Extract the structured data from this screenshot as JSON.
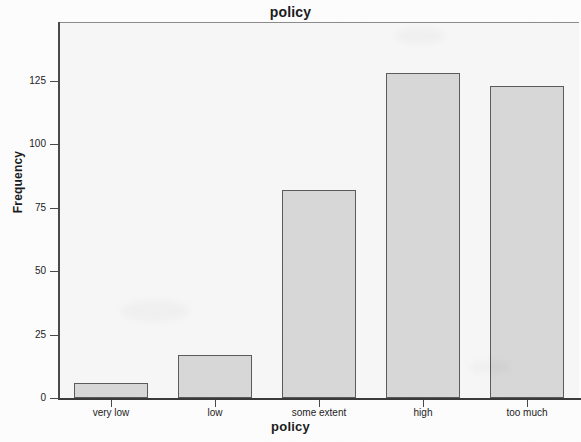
{
  "chart_data": {
    "type": "bar",
    "title": "policy",
    "xlabel": "policy",
    "ylabel": "Frequency",
    "categories": [
      "very low",
      "low",
      "some extent",
      "high",
      "too much"
    ],
    "values": [
      6,
      17,
      82,
      128,
      123
    ],
    "yticks": [
      0,
      25,
      50,
      75,
      100,
      125
    ],
    "ytick_labels": [
      "0",
      "25",
      "50",
      "75",
      "100",
      "125"
    ],
    "ylim": [
      0,
      148
    ],
    "grid": false,
    "legend": null,
    "bar_fill_color": "#d8d8d8",
    "bar_edge_color": "#5c5c5c",
    "plot_background_color": "#f7f7f7",
    "figure_background_color": "#fdfdfd",
    "axis_color": "#4a4a4a",
    "text_color": "#1d1d1d"
  }
}
